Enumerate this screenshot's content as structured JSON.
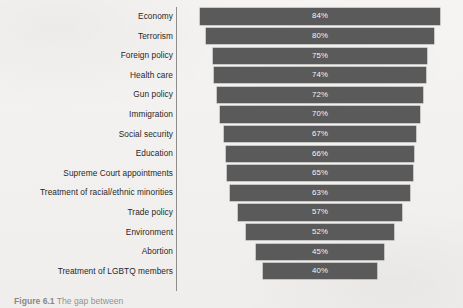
{
  "figure": {
    "caption_label": "Figure 6.1",
    "caption_text": "The gap between"
  },
  "chart_data": {
    "type": "bar",
    "orientation": "horizontal",
    "bar_alignment": "centered",
    "title": "",
    "xlabel": "",
    "ylabel": "",
    "grid": false,
    "legend": "none",
    "xlim": [
      0,
      100
    ],
    "value_suffix": "%",
    "bar_color": "#5a5a5a",
    "value_label_color": "#f4f4f4",
    "axis_color": "#8d8d8d",
    "background_color": "#f3f2f0",
    "categories": [
      "Economy",
      "Terrorism",
      "Foreign policy",
      "Health care",
      "Gun policy",
      "Immigration",
      "Social security",
      "Education",
      "Supreme Court appointments",
      "Treatment of racial/ethnic minorities",
      "Trade policy",
      "Environment",
      "Abortion",
      "Treatment of LGBTQ members"
    ],
    "values": [
      84,
      80,
      75,
      74,
      72,
      70,
      67,
      66,
      65,
      63,
      57,
      52,
      45,
      40
    ],
    "value_labels": [
      "84%",
      "80%",
      "75%",
      "74%",
      "72%",
      "70%",
      "67%",
      "66%",
      "65%",
      "63%",
      "57%",
      "52%",
      "45%",
      "40%"
    ]
  }
}
